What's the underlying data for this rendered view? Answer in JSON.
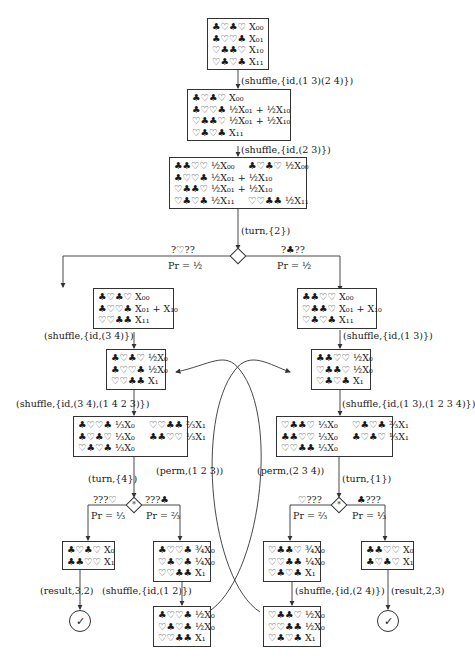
{
  "nodes": {
    "n1": {
      "lines": [
        "♣♡♣♡ X₀₀",
        "♣♡♡♣ X₀₁",
        "♡♣♣♡ X₁₀",
        "♡♣♡♣ X₁₁"
      ]
    },
    "n2": {
      "lines": [
        "♣♡♣♡ X₀₀",
        "♣♡♡♣ ½X₀₁ + ½X₁₀",
        "♡♣♣♡ ½X₀₁ + ½X₁₀",
        "♡♣♡♣ X₁₁"
      ]
    },
    "n3": {
      "left": [
        "♣♣♡♡ ½X₀₀",
        "♣♡♡♣ ½X₀₁ + ½X₁₀",
        "♡♣♣♡ ½X₀₁ + ½X₁₀",
        "♡♣♡♣ ½X₁₁"
      ],
      "right": [
        "♣♡♣♡ ½X₀₀",
        "",
        "",
        "♡♡♣♣ ½X₁₁"
      ]
    },
    "n4L": {
      "lines": [
        "♣♡♣♡ X₀₀",
        "♣♡♡♣ X₀₁ + X₁₀",
        "♡♡♣♣ X₁₁"
      ]
    },
    "n4R": {
      "lines": [
        "♣♣♡♡ X₀₀",
        "♡♣♣♡ X₀₁ + X₁₀",
        "♡♣♡♣ X₁₁"
      ]
    },
    "n5L": {
      "lines": [
        "♣♡♣♡ ½X₀",
        "♣♡♡♣ ½X₀",
        "♡♡♣♣ X₁"
      ]
    },
    "n5R": {
      "lines": [
        "♣♣♡♡ ½X₀",
        "♡♣♣♡ ½X₀",
        "♡♣♡♣ X₁"
      ]
    },
    "n6L": {
      "left": [
        "♣♡♡♣ ⅓X₀",
        "♣♡♣♡ ⅓X₀",
        "♡♣♡♣ ⅓X₀"
      ],
      "right": [
        "♡♡♣♣ ⅔X₁",
        "♣♣♡♡ ⅓X₁"
      ]
    },
    "n6R": {
      "left": [
        "♡♣♣♡ ⅓X₀",
        "♣♣♡♡ ⅓X₀",
        "♡♡♣♣ ⅓X₀"
      ],
      "right": [
        "♡♣♡♣ ⅔X₁",
        "♣♡♣♡ ⅓X₁"
      ]
    },
    "n7LL": {
      "lines": [
        "♣♡♣♡ X₀",
        "♣♣♡♡ X₁"
      ]
    },
    "n7LR": {
      "lines": [
        "♣♡♡♣ ¾X₀",
        "♡♣♡♣ ¼X₀",
        "♡♡♣♣ X₁"
      ]
    },
    "n7RL": {
      "lines": [
        "♡♣♣♡ ¾X₀",
        "♡♡♣♣ ¼X₀",
        "♡♣♡♣ X₁"
      ]
    },
    "n7RR": {
      "lines": [
        "♣♣♡♡ X₀",
        "♣♡♣♡ X₁"
      ]
    },
    "n8L": {
      "lines": [
        "♣♡♡♣ ½X₀",
        "♡♣♡♣ ½X₀",
        "♡♡♣♣ X₁"
      ]
    },
    "n8R": {
      "lines": [
        "♡♣♣♡ ½X₀",
        "♡♡♣♣ ½X₀",
        "♡♣♡♣ X₁"
      ]
    }
  },
  "edges": {
    "e1": "(shuffle,{id,(1 3)(2 4)})",
    "e2": "(shuffle,{id,(2 3)})",
    "e3": "(turn,{2})",
    "e4L": "(shuffle,{id,(3 4)})",
    "e4R": "(shuffle,{id,(1 3)})",
    "e5L": "(shuffle,{id,(3 4),(1 4 2 3)})",
    "e5R": "(shuffle,{id,(1 3),(1 2 3 4)})",
    "e6L": "(turn,{4})",
    "e6R": "(turn,{1})",
    "permL": "(perm,(1 2 3))",
    "permR": "(perm,(2 3 4))",
    "e8L": "(shuffle,{id,(1 2)})",
    "e8R": "(shuffle,{id,(2 4)})",
    "resL": "(result,3,2)",
    "resR": "(result,2,3)"
  },
  "branches": {
    "d1": {
      "left_obs": "?♡??",
      "left_pr": "Pr = ½",
      "right_obs": "?♣??",
      "right_pr": "Pr = ½"
    },
    "dL": {
      "left_obs": "???♡",
      "left_pr": "Pr = ⅓",
      "right_obs": "???♣",
      "right_pr": "Pr = ⅔",
      "symbol": "*"
    },
    "dR": {
      "left_obs": "♡???",
      "left_pr": "Pr = ⅔",
      "right_obs": "♣???",
      "right_pr": "Pr = ⅓",
      "symbol": "*"
    }
  },
  "terminals": {
    "check": "✓"
  }
}
